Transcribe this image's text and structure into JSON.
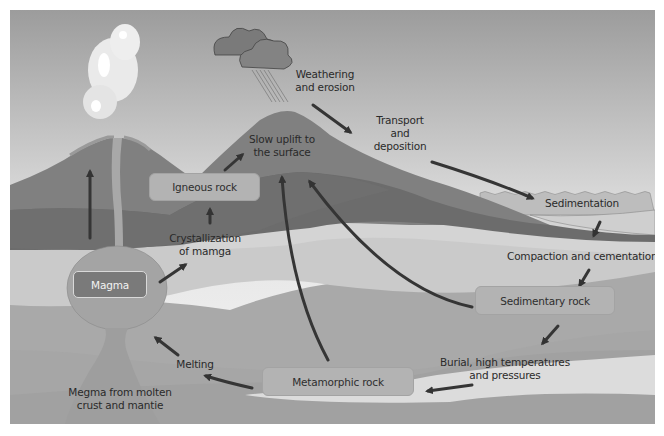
{
  "diagram": {
    "boxes": {
      "magma": "Magma",
      "igneous_rock": "Igneous rock",
      "sedimentary_rock": "Sedimentary rock",
      "metamorphic_rock": "Metamorphic rock"
    },
    "labels": {
      "weathering": [
        "Weathering",
        "and erosion"
      ],
      "transport": [
        "Transport",
        "and",
        "deposition"
      ],
      "uplift": [
        "Slow uplift to",
        "the surface"
      ],
      "sedimentation": "Sedimentation",
      "compaction": "Compaction and cementation",
      "crystallization": [
        "Crystallization",
        "of mamga"
      ],
      "burial": [
        "Burial, high temperatures",
        "and pressures"
      ],
      "melting": "Melting",
      "magma_source": [
        "Megma from molten",
        "crust and mantie"
      ]
    },
    "colors": {
      "sky_top": "#9a9a9a",
      "sky_bottom": "#f2f2f2",
      "mountain_outer": "#7d7d7d",
      "mountain_inner": "#6a6a6a",
      "light_layer": "#c9c9c9",
      "mid_layer": "#a9a9a9",
      "deep_layer": "#9a9a9a",
      "arrow": "#333333",
      "water": "#b8b8b8"
    }
  }
}
